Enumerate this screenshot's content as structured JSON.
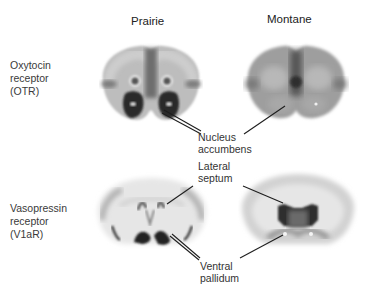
{
  "figure": {
    "column_headers": [
      "Prairie",
      "Montane"
    ],
    "row_labels": [
      "Oxytocin\nreceptor\n(OTR)",
      "Vasopressin\nreceptor\n(V1aR)"
    ],
    "callouts": {
      "nucleus_accumbens": "Nucleus\naccumbens",
      "lateral_septum": "Lateral\nseptum",
      "ventral_pallidum": "Ventral\npallidum"
    },
    "panels": [
      {
        "row": "OTR",
        "species": "Prairie",
        "description": "Coronal brain section autoradiograph with dense OTR binding in nucleus accumbens"
      },
      {
        "row": "OTR",
        "species": "Montane",
        "description": "Coronal brain section autoradiograph with diffuse OTR binding, low in nucleus accumbens"
      },
      {
        "row": "V1aR",
        "species": "Prairie",
        "description": "Coronal brain section autoradiograph with dense V1aR binding in ventral pallidum"
      },
      {
        "row": "V1aR",
        "species": "Montane",
        "description": "Coronal brain section autoradiograph with dense V1aR binding in lateral septum"
      }
    ],
    "colors": {
      "ink": "#2a2a2a",
      "tissue_light": "#cfcfcf",
      "tissue_mid": "#8a8a8a",
      "tissue_dark": "#2e2e2e"
    }
  }
}
